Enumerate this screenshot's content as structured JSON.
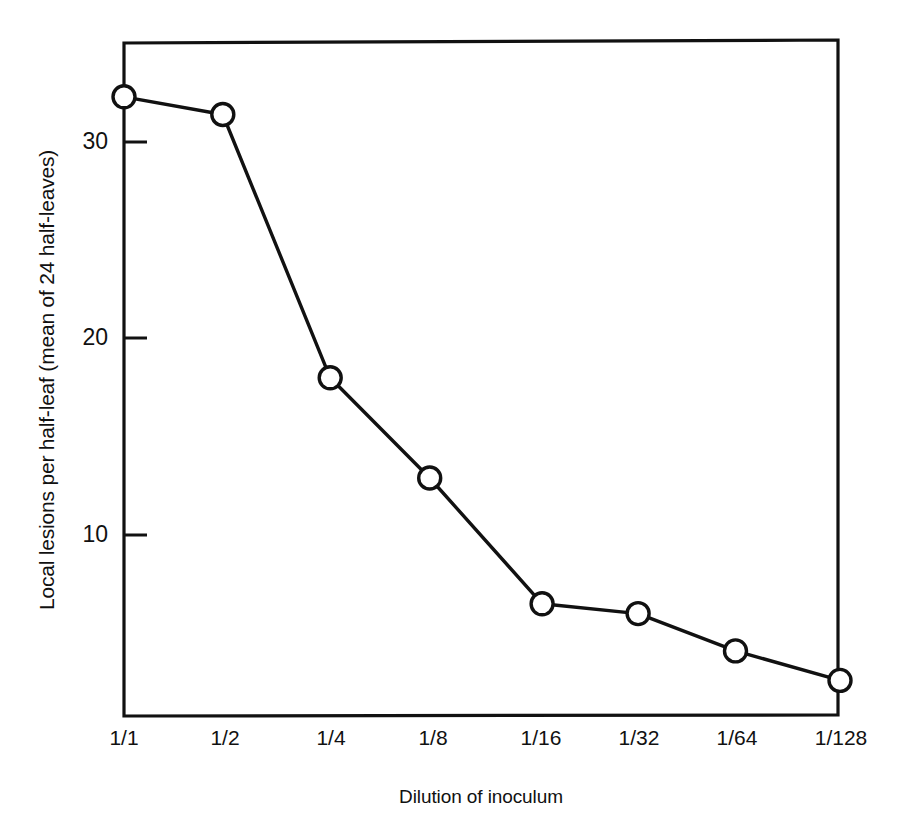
{
  "chart_data": {
    "type": "line",
    "title": "",
    "subtitle": "",
    "xlabel": "Dilution of inoculum",
    "ylabel": "Local lesions per half-leaf (mean of 24 half-leaves)",
    "categories": [
      "1/1",
      "1/2",
      "1/4",
      "1/8",
      "1/16",
      "1/32",
      "1/64",
      "1/128"
    ],
    "values": [
      32.3,
      31.4,
      18.0,
      12.9,
      6.5,
      6.0,
      4.1,
      2.6
    ],
    "series": [
      {
        "name": "Local lesions per half-leaf",
        "values": [
          32.3,
          31.4,
          18.0,
          12.9,
          6.5,
          6.0,
          4.1,
          2.6
        ]
      }
    ],
    "ylim": [
      0.0,
      34.3
    ],
    "ytick_values": [
      10,
      20,
      30
    ],
    "ytick_labels": [
      "10",
      "20",
      "30"
    ],
    "xtick_labels": [
      "1/1",
      "1/2",
      "1/4",
      "1/8",
      "1/16",
      "1/32",
      "1/64",
      "1/128"
    ],
    "grid": false,
    "legend": false,
    "legend_position": "none",
    "marker": "open-circle",
    "line_color": "#111111",
    "marker_fill": "#ffffff",
    "marker_edge_color": "#111111",
    "background_color": "#ffffff",
    "frame": "box",
    "tick_direction": "in",
    "x_tick_marks": false,
    "annotations": []
  },
  "axis": {
    "y_title": "Local lesions per half-leaf (mean of 24 half-leaves)",
    "x_title": "Dilution of inoculum",
    "y_ticks": [
      {
        "label": "30",
        "value": 30
      },
      {
        "label": "20",
        "value": 20
      },
      {
        "label": "10",
        "value": 10
      }
    ],
    "x_ticks": [
      {
        "label": "1/1"
      },
      {
        "label": "1/2"
      },
      {
        "label": "1/4"
      },
      {
        "label": "1/8"
      },
      {
        "label": "1/16"
      },
      {
        "label": "1/32"
      },
      {
        "label": "1/64"
      },
      {
        "label": "1/128"
      }
    ]
  }
}
